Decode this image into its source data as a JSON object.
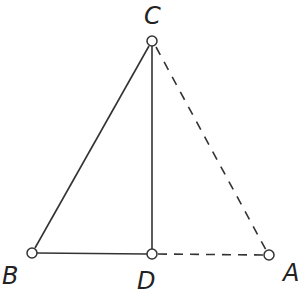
{
  "diagram": {
    "points": {
      "C": {
        "label": "C",
        "x": 152,
        "y": 41
      },
      "B": {
        "label": "B",
        "x": 32,
        "y": 253
      },
      "D": {
        "label": "D",
        "x": 152,
        "y": 254
      },
      "A": {
        "label": "A",
        "x": 269,
        "y": 255
      }
    },
    "segments": [
      {
        "from": "B",
        "to": "C",
        "style": "solid"
      },
      {
        "from": "C",
        "to": "D",
        "style": "solid"
      },
      {
        "from": "B",
        "to": "D",
        "style": "solid"
      },
      {
        "from": "C",
        "to": "A",
        "style": "dashed"
      },
      {
        "from": "D",
        "to": "A",
        "style": "dashed"
      }
    ],
    "colors": {
      "stroke": "#333333",
      "background": "#ffffff"
    }
  }
}
